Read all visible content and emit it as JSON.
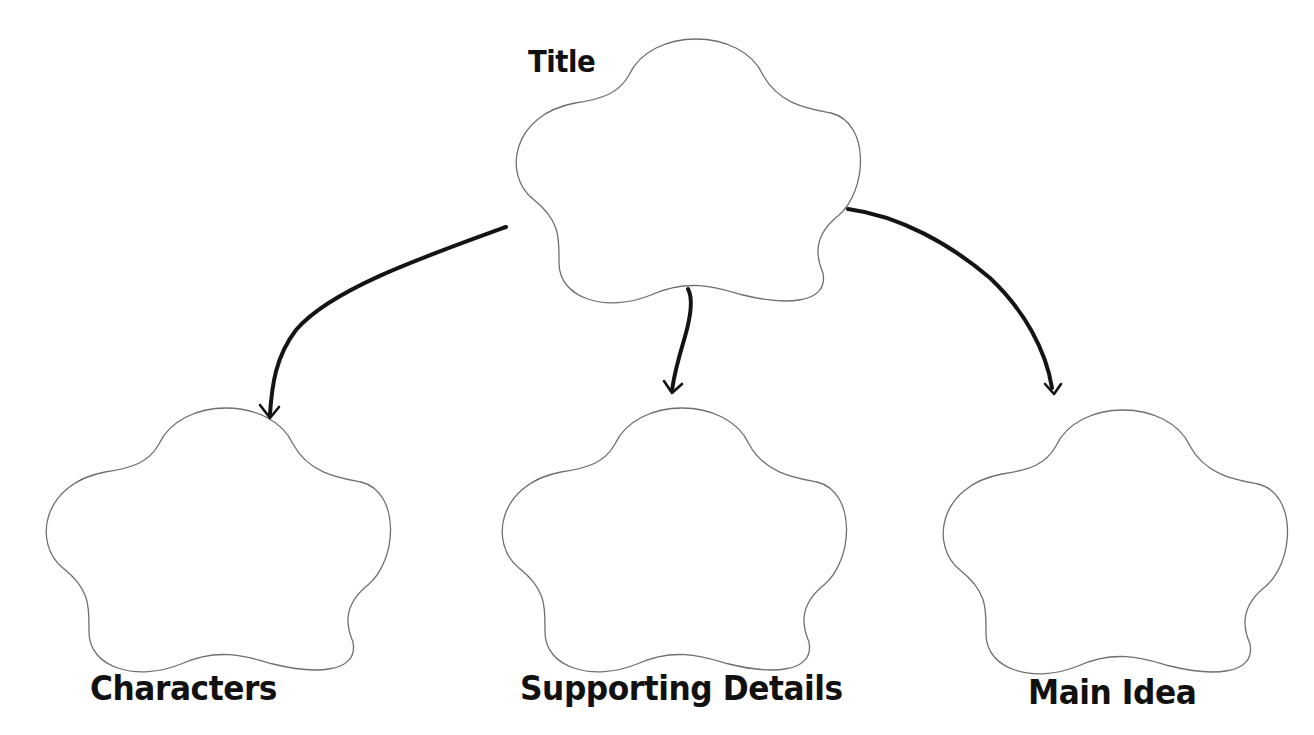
{
  "diagram": {
    "type": "graphic-organizer",
    "root": {
      "label": "Title",
      "shape": "flower-cloud"
    },
    "children": [
      {
        "label": "Characters",
        "shape": "flower-cloud"
      },
      {
        "label": "Supporting Details",
        "shape": "flower-cloud"
      },
      {
        "label": "Main Idea",
        "shape": "flower-cloud"
      }
    ],
    "edges": [
      {
        "from": "Title",
        "to": "Characters",
        "style": "hand-drawn-arrow"
      },
      {
        "from": "Title",
        "to": "Supporting Details",
        "style": "hand-drawn-arrow"
      },
      {
        "from": "Title",
        "to": "Main Idea",
        "style": "hand-drawn-arrow"
      }
    ],
    "colors": {
      "background": "#ffffff",
      "outline": "#6f6f6f",
      "arrow": "#141414",
      "text": "#111111"
    }
  }
}
